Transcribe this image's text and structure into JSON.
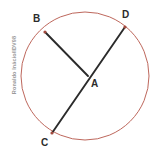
{
  "figure": {
    "kind": "circle-geometry-diagram",
    "background_color": "#ffffff",
    "circle": {
      "stroke_color": "#b5564a",
      "stroke_width": 0.9,
      "cx": 85,
      "cy": 76,
      "r": 64
    },
    "chord_color": "#2b2b2b",
    "chord_width": 1.9,
    "vertex_dot_color": "#a34a3e",
    "points": [
      {
        "id": "B",
        "label": "B",
        "x": 45,
        "y": 32,
        "label_x": 33,
        "label_y": 14,
        "on_circle": true
      },
      {
        "id": "D",
        "label": "D",
        "x": 125,
        "y": 27,
        "label_x": 122,
        "label_y": 10,
        "on_circle": true
      },
      {
        "id": "C",
        "label": "C",
        "x": 52,
        "y": 133,
        "label_x": 41,
        "label_y": 138,
        "on_circle": true
      },
      {
        "id": "A",
        "label": "A",
        "x": 88,
        "y": 76,
        "label_x": 91,
        "label_y": 79,
        "on_circle": false
      }
    ],
    "segments": [
      {
        "id": "BA",
        "from": "B",
        "to": "A",
        "x1": 45,
        "y1": 32,
        "x2": 88,
        "y2": 76
      },
      {
        "id": "CD",
        "from": "C",
        "to": "D",
        "x1": 52,
        "y1": 133,
        "x2": 125,
        "y2": 27
      }
    ]
  },
  "watermark": {
    "text": "Ronaldo Inácio/IDV98",
    "color": "#9a9a9a",
    "orientation": "vertical-rotated-left"
  }
}
